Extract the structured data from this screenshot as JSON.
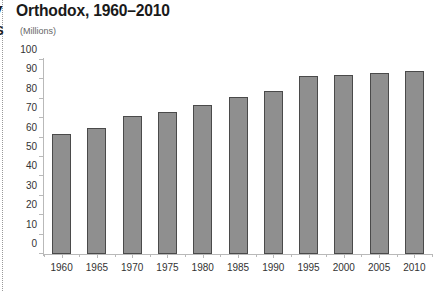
{
  "header": {
    "title": "Orthodox, 1960–2010",
    "title_clipped_fragment": "y",
    "subtitle": "(Millions)",
    "subtitle_clipped_fragment": "S"
  },
  "chart_data": {
    "type": "bar",
    "title": "Orthodox, 1960–2010",
    "subtitle": "(Millions)",
    "xlabel": "",
    "ylabel": "Millions",
    "categories": [
      "1960",
      "1965",
      "1970",
      "1975",
      "1980",
      "1985",
      "1990",
      "1995",
      "2000",
      "2005",
      "2010"
    ],
    "values": [
      62,
      65,
      71,
      73,
      77,
      81,
      84,
      92,
      92.5,
      93.5,
      94.5
    ],
    "ylim": [
      0,
      100
    ],
    "yticks": [
      0,
      10,
      20,
      30,
      40,
      50,
      60,
      70,
      80,
      90,
      100
    ],
    "grid": false,
    "legend": "none",
    "series": [
      {
        "name": "Orthodox population",
        "values": [
          62,
          65,
          71,
          73,
          77,
          81,
          84,
          92,
          92.5,
          93.5,
          94.5
        ]
      }
    ]
  },
  "style": {
    "bar_fill": "#8f8f8f",
    "bar_border": "#4a4a4a",
    "axis_color": "#b9b9b9",
    "text_color": "#333333",
    "background": "#ffffff"
  }
}
